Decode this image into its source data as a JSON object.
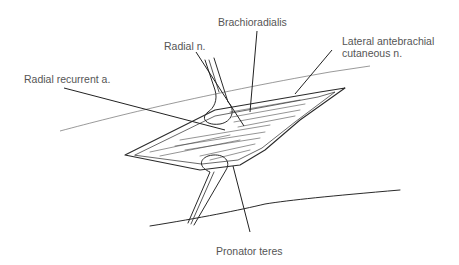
{
  "figure": {
    "labels": [
      {
        "id": "brachioradialis",
        "text": "Brachioradialis"
      },
      {
        "id": "radial-n",
        "text": "Radial n."
      },
      {
        "id": "lateral-antebrachial",
        "line1": "Lateral antebrachial",
        "line2": "cutaneous n."
      },
      {
        "id": "radial-recurrent",
        "text": "Radial recurrent a."
      },
      {
        "id": "pronator-teres",
        "text": "Pronator teres"
      }
    ]
  }
}
